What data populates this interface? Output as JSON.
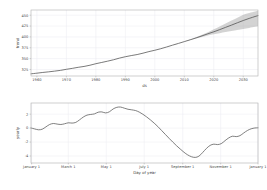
{
  "figure": {
    "title": "",
    "background_color": "#ffffff",
    "line_color": "#4d4d4d",
    "band_color": "#8c8c8c",
    "grid_color": "#ededf2"
  },
  "chart_data": [
    {
      "type": "line",
      "name": "trend",
      "title": "",
      "xlabel": "ds",
      "ylabel": "trend",
      "grid": true,
      "legend": "none",
      "xlim": [
        1958,
        2035
      ],
      "ylim": [
        310,
        462
      ],
      "xticks": [
        1960,
        1970,
        1980,
        1990,
        2000,
        2010,
        2020,
        2030
      ],
      "xticklabels": [
        "1960",
        "1970",
        "1980",
        "1990",
        "2000",
        "2010",
        "2020",
        "2030"
      ],
      "yticks": [
        325,
        350,
        375,
        400,
        425,
        450
      ],
      "yticklabels": [
        "325",
        "350",
        "375",
        "400",
        "425",
        "450"
      ],
      "x": [
        1958,
        1960,
        1962,
        1964,
        1966,
        1968,
        1970,
        1972,
        1974,
        1976,
        1978,
        1980,
        1982,
        1984,
        1986,
        1988,
        1990,
        1992,
        1994,
        1996,
        1998,
        2000,
        2002,
        2004,
        2006,
        2008,
        2010,
        2012,
        2014,
        2016,
        2018,
        2020,
        2022,
        2024,
        2026,
        2028,
        2030,
        2032,
        2034,
        2035
      ],
      "y": [
        315.0,
        316.5,
        318.2,
        319.6,
        321.2,
        323.0,
        325.4,
        327.6,
        330.0,
        332.0,
        334.8,
        338.3,
        341.2,
        344.2,
        347.4,
        351.2,
        354.4,
        357.0,
        359.4,
        362.6,
        366.2,
        369.3,
        372.8,
        376.8,
        381.0,
        385.0,
        389.2,
        393.4,
        397.8,
        402.4,
        407.2,
        411.8,
        416.8,
        422.0,
        427.2,
        432.6,
        437.8,
        442.6,
        447.0,
        449.0
      ],
      "uncertainty_lower": [
        315.0,
        316.5,
        318.2,
        319.6,
        321.2,
        323.0,
        325.4,
        327.6,
        330.0,
        332.0,
        334.8,
        338.3,
        341.2,
        344.2,
        347.4,
        351.2,
        354.4,
        357.0,
        359.4,
        362.6,
        366.2,
        369.3,
        372.8,
        376.8,
        381.0,
        385.0,
        389.2,
        393.0,
        396.6,
        400.0,
        403.2,
        406.0,
        408.6,
        411.2,
        413.6,
        416.0,
        418.4,
        420.8,
        423.2,
        424.4
      ],
      "uncertainty_upper": [
        315.0,
        316.5,
        318.2,
        319.6,
        321.2,
        323.0,
        325.4,
        327.6,
        330.0,
        332.0,
        334.8,
        338.3,
        341.2,
        344.2,
        347.4,
        351.2,
        354.4,
        357.0,
        359.4,
        362.6,
        366.2,
        369.3,
        372.8,
        376.8,
        381.0,
        385.0,
        389.4,
        394.0,
        399.2,
        404.8,
        411.0,
        417.4,
        424.0,
        430.8,
        437.6,
        444.4,
        451.2,
        455.0,
        458.4,
        460.0
      ],
      "forecast_start_x": 2010
    },
    {
      "type": "line",
      "name": "yearly",
      "title": "",
      "xlabel": "Day of year",
      "ylabel": "yearly",
      "grid": true,
      "legend": "none",
      "xlim": [
        0,
        365
      ],
      "ylim": [
        -5.0,
        3.6
      ],
      "xticks": [
        1,
        60,
        121,
        182,
        244,
        305,
        365
      ],
      "xticklabels": [
        "January 1",
        "March 1",
        "May 1",
        "July 1",
        "September 1",
        "November 1",
        "January 1"
      ],
      "yticks": [
        -4,
        -2,
        0,
        2
      ],
      "yticklabels": [
        "-4",
        "-2",
        "0",
        "2"
      ],
      "x": [
        0,
        6,
        12,
        18,
        24,
        30,
        36,
        42,
        48,
        54,
        60,
        66,
        72,
        78,
        84,
        90,
        96,
        102,
        108,
        114,
        120,
        126,
        132,
        138,
        144,
        150,
        156,
        162,
        168,
        174,
        180,
        186,
        192,
        198,
        204,
        210,
        216,
        222,
        228,
        234,
        240,
        246,
        252,
        258,
        264,
        270,
        276,
        282,
        288,
        294,
        300,
        306,
        312,
        318,
        324,
        330,
        336,
        342,
        348,
        354,
        360,
        365
      ],
      "y": [
        0.02,
        -0.12,
        -0.24,
        -0.16,
        0.18,
        0.52,
        0.66,
        0.58,
        0.52,
        0.62,
        0.76,
        0.72,
        0.82,
        1.18,
        1.58,
        1.86,
        1.96,
        2.04,
        2.28,
        2.32,
        2.18,
        2.34,
        2.74,
        2.98,
        3.02,
        2.86,
        2.7,
        2.62,
        2.52,
        2.3,
        1.98,
        1.6,
        1.18,
        0.72,
        0.22,
        -0.34,
        -0.9,
        -1.46,
        -2.0,
        -2.52,
        -3.0,
        -3.46,
        -3.84,
        -4.1,
        -4.2,
        -4.02,
        -3.5,
        -2.92,
        -2.48,
        -2.3,
        -2.36,
        -2.22,
        -1.8,
        -1.4,
        -1.16,
        -1.22,
        -1.08,
        -0.7,
        -0.34,
        -0.1,
        0.02,
        0.04
      ]
    }
  ]
}
